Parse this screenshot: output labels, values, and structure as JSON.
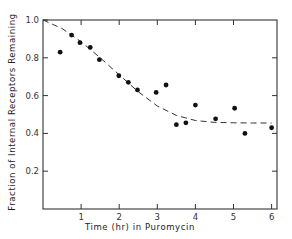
{
  "chart_data": {
    "type": "scatter",
    "title": "",
    "xlabel": "Time (hr) in Puromycin",
    "ylabel": "Fraction of Internal Receptors Remaining",
    "xlim": [
      0,
      6.15
    ],
    "ylim": [
      0,
      1.0
    ],
    "x_ticks": [
      1,
      2,
      3,
      4,
      5,
      6
    ],
    "x_tick_labels": [
      "1",
      "2",
      "3",
      "4",
      "5",
      "6"
    ],
    "y_ticks": [
      0.2,
      0.4,
      0.6,
      0.8,
      1.0
    ],
    "y_tick_labels": [
      "0.2",
      "0.4",
      "0.6",
      "0.8",
      "1.0"
    ],
    "grid": false,
    "legend": null,
    "series": [
      {
        "name": "Measured",
        "style": "filled-circle-markers",
        "x": [
          0.45,
          0.75,
          0.97,
          1.24,
          1.48,
          1.99,
          2.24,
          2.48,
          2.97,
          3.23,
          3.5,
          3.75,
          4.0,
          4.53,
          5.03,
          5.3,
          6.0
        ],
        "y": [
          0.83,
          0.92,
          0.88,
          0.855,
          0.79,
          0.705,
          0.67,
          0.63,
          0.617,
          0.656,
          0.446,
          0.456,
          0.55,
          0.477,
          0.533,
          0.4,
          0.43
        ]
      },
      {
        "name": "Fitted curve",
        "style": "dashed-line",
        "x": [
          0,
          0.5,
          1.0,
          1.5,
          2.0,
          2.5,
          3.0,
          3.5,
          4.0,
          4.5,
          5.0,
          5.5,
          6.0
        ],
        "y": [
          1.0,
          0.955,
          0.885,
          0.8,
          0.71,
          0.62,
          0.545,
          0.495,
          0.468,
          0.458,
          0.456,
          0.455,
          0.455
        ]
      }
    ]
  }
}
